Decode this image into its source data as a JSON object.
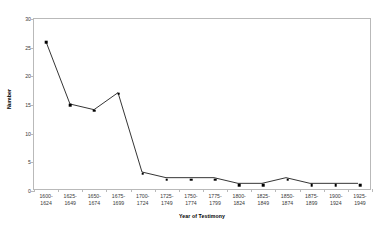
{
  "chart_data": {
    "type": "line",
    "title": "",
    "xlabel": "Year of Testimony",
    "ylabel": "Number",
    "categories": [
      "1600-\n1624",
      "1625-\n1649",
      "1650-\n1674",
      "1675-\n1699",
      "1700-\n1724",
      "1725-\n1749",
      "1750-\n1774",
      "1775-\n1799",
      "1800-\n1824",
      "1825-\n1849",
      "1850-\n1874",
      "1875-\n1899",
      "1900-\n1924",
      "1925-\n1949"
    ],
    "category_labels": [
      {
        "top": "1600-",
        "bottom": "1624"
      },
      {
        "top": "1625-",
        "bottom": "1649"
      },
      {
        "top": "1650-",
        "bottom": "1674"
      },
      {
        "top": "1675-",
        "bottom": "1699"
      },
      {
        "top": "1700-",
        "bottom": "1724"
      },
      {
        "top": "1725-",
        "bottom": "1749"
      },
      {
        "top": "1750-",
        "bottom": "1774"
      },
      {
        "top": "1775-",
        "bottom": "1799"
      },
      {
        "top": "1800-",
        "bottom": "1824"
      },
      {
        "top": "1825-",
        "bottom": "1849"
      },
      {
        "top": "1850-",
        "bottom": "1874"
      },
      {
        "top": "1875-",
        "bottom": "1899"
      },
      {
        "top": "1900-",
        "bottom": "1924"
      },
      {
        "top": "1925-",
        "bottom": "1949"
      }
    ],
    "values": [
      26,
      15,
      14,
      17,
      3,
      2,
      2,
      2,
      1,
      1,
      2,
      1,
      1,
      1
    ],
    "ylim": [
      0,
      30
    ],
    "yticks": [
      0,
      5,
      10,
      15,
      20,
      25,
      30
    ],
    "ytick_labels": [
      "0",
      "5",
      "10",
      "15",
      "20",
      "25",
      "30"
    ],
    "grid": false,
    "legend": "none",
    "series_color": "#000000",
    "marker": "square",
    "frame_color": "#b9b9b9"
  }
}
